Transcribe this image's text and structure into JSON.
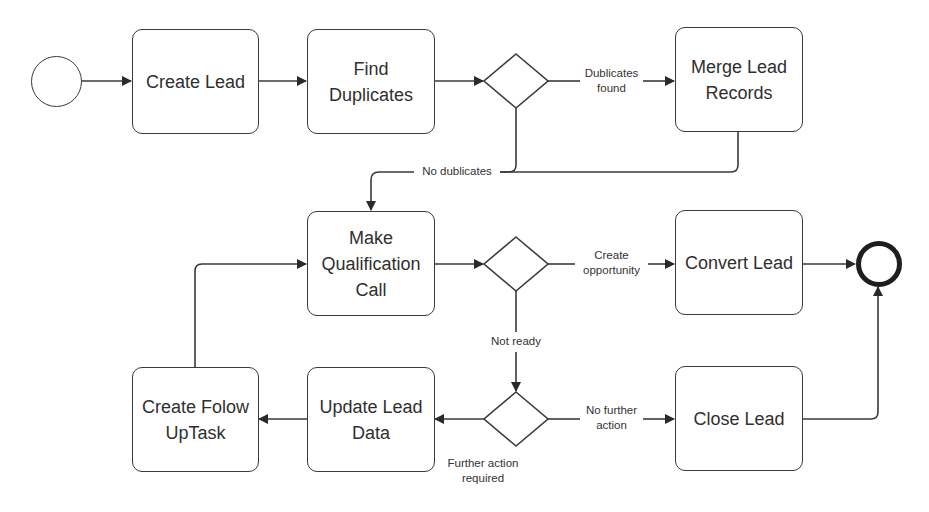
{
  "diagram": {
    "type": "bpmn-process",
    "colors": {
      "stroke": "#3a3a3a",
      "text": "#2f2f2f",
      "end_event_stroke": "#1e1e1e",
      "background": "#ffffff"
    },
    "events": {
      "start": {
        "label": ""
      },
      "end": {
        "label": ""
      }
    },
    "tasks": {
      "create_lead": {
        "lines": [
          "Create Lead"
        ]
      },
      "find_duplicates": {
        "lines": [
          "Find",
          "Duplicates"
        ]
      },
      "merge_lead_records": {
        "lines": [
          "Merge Lead",
          "Records"
        ]
      },
      "make_qualification_call": {
        "lines": [
          "Make",
          "Qualification",
          "Call"
        ]
      },
      "convert_lead": {
        "lines": [
          "Convert Lead"
        ]
      },
      "create_follow_up_task": {
        "lines": [
          "Create Folow",
          "UpTask"
        ]
      },
      "update_lead_data": {
        "lines": [
          "Update Lead",
          "Data"
        ]
      },
      "close_lead": {
        "lines": [
          "Close Lead"
        ]
      }
    },
    "gateways": {
      "duplicates_check": {
        "type": "exclusive"
      },
      "qualification_result": {
        "type": "exclusive"
      },
      "further_action_check": {
        "type": "exclusive"
      }
    },
    "flow_labels": {
      "duplicates_found": [
        "Dublicates",
        "found"
      ],
      "no_duplicates": [
        "No dublicates"
      ],
      "create_opportunity": [
        "Create",
        "opportunity"
      ],
      "not_ready": [
        "Not ready"
      ],
      "no_further_action": [
        "No further",
        "action"
      ],
      "further_action_required": [
        "Further action",
        "required"
      ]
    },
    "flows": [
      {
        "from": "start",
        "to": "create_lead"
      },
      {
        "from": "create_lead",
        "to": "find_duplicates"
      },
      {
        "from": "find_duplicates",
        "to": "duplicates_check"
      },
      {
        "from": "duplicates_check",
        "to": "merge_lead_records",
        "label": "Dublicates found"
      },
      {
        "from": "duplicates_check",
        "to": "make_qualification_call",
        "label": "No dublicates"
      },
      {
        "from": "merge_lead_records",
        "to": "make_qualification_call"
      },
      {
        "from": "make_qualification_call",
        "to": "qualification_result"
      },
      {
        "from": "qualification_result",
        "to": "convert_lead",
        "label": "Create opportunity"
      },
      {
        "from": "qualification_result",
        "to": "further_action_check",
        "label": "Not ready"
      },
      {
        "from": "convert_lead",
        "to": "end"
      },
      {
        "from": "further_action_check",
        "to": "close_lead",
        "label": "No further action"
      },
      {
        "from": "further_action_check",
        "to": "update_lead_data",
        "label": "Further action required"
      },
      {
        "from": "close_lead",
        "to": "end"
      },
      {
        "from": "update_lead_data",
        "to": "create_follow_up_task"
      },
      {
        "from": "create_follow_up_task",
        "to": "make_qualification_call"
      }
    ]
  }
}
